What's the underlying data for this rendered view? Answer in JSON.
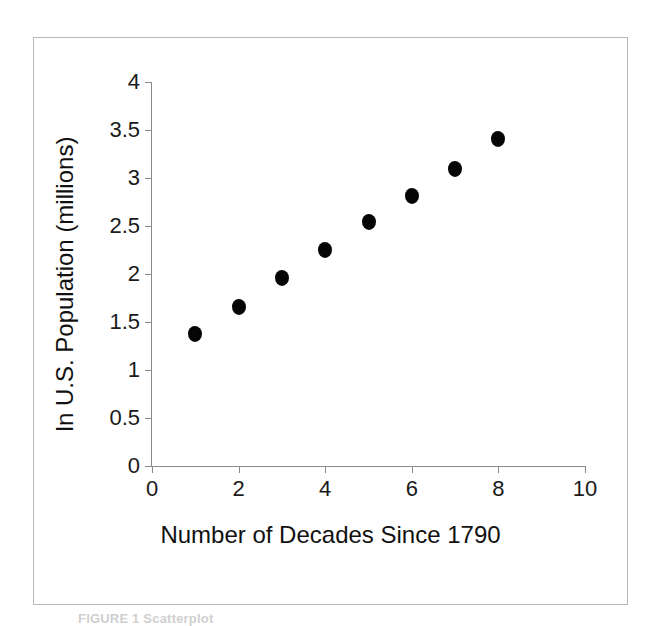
{
  "figure": {
    "caption": "FIGURE 1  Scatterplot",
    "background_color": "#ffffff",
    "frame_color": "#b7b7b7",
    "point_color": "#050505",
    "axis_color": "#8a8a8a"
  },
  "chart_data": {
    "type": "scatter",
    "title": "",
    "xlabel": "Number of Decades Since 1790",
    "ylabel": "ln U.S. Population (millions)",
    "xlim": [
      0,
      10
    ],
    "ylim": [
      0,
      4
    ],
    "grid": false,
    "legend": null,
    "x_ticks": [
      "0",
      "2",
      "4",
      "6",
      "8",
      "10"
    ],
    "x_tick_values": [
      0,
      2,
      4,
      6,
      8,
      10
    ],
    "y_ticks": [
      "0",
      "0.5",
      "1",
      "1.5",
      "2",
      "2.5",
      "3",
      "3.5",
      "4"
    ],
    "y_tick_values": [
      0,
      0.5,
      1,
      1.5,
      2,
      2.5,
      3,
      3.5,
      4
    ],
    "x": [
      1,
      2,
      3,
      4,
      5,
      6,
      7,
      8
    ],
    "y": [
      1.37,
      1.66,
      1.96,
      2.25,
      2.54,
      2.81,
      3.09,
      3.41
    ],
    "points": [
      {
        "x": 1,
        "y": 1.37
      },
      {
        "x": 2,
        "y": 1.66
      },
      {
        "x": 3,
        "y": 1.96
      },
      {
        "x": 4,
        "y": 2.25
      },
      {
        "x": 5,
        "y": 2.54
      },
      {
        "x": 6,
        "y": 2.81
      },
      {
        "x": 7,
        "y": 3.09
      },
      {
        "x": 8,
        "y": 3.41
      }
    ]
  }
}
